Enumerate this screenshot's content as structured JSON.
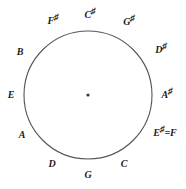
{
  "diagram": {
    "circle": {
      "center_x": 88,
      "center_y": 95,
      "radius": 64,
      "stroke_color": "#555555",
      "fill_color": "#ffffff"
    },
    "spokes": {
      "count": 12,
      "stroke_color": "#4a4a4a",
      "angle_step_degrees": 30
    },
    "notes": [
      {
        "id": "note-c-sharp",
        "label": "C♯",
        "base": "C",
        "accidental": "♯",
        "angle_degrees": 90,
        "label_x": 90,
        "label_y": 15
      },
      {
        "id": "note-g-sharp",
        "label": "G♯",
        "base": "G",
        "accidental": "♯",
        "angle_degrees": 60,
        "label_x": 129,
        "label_y": 22
      },
      {
        "id": "note-d-sharp",
        "label": "D♯",
        "base": "D",
        "accidental": "♯",
        "angle_degrees": 30,
        "label_x": 161,
        "label_y": 50
      },
      {
        "id": "note-a-sharp",
        "label": "A♯",
        "base": "A",
        "accidental": "♯",
        "angle_degrees": 0,
        "label_x": 167,
        "label_y": 95
      },
      {
        "id": "note-e-sharp-f",
        "label": "E♯=F",
        "base": "E",
        "accidental": "♯",
        "equals": "=F",
        "angle_degrees": -30,
        "label_x": 165,
        "label_y": 133
      },
      {
        "id": "note-c",
        "label": "C",
        "base": "C",
        "accidental": "",
        "angle_degrees": -60,
        "label_x": 124,
        "label_y": 164
      },
      {
        "id": "note-g",
        "label": "G",
        "base": "G",
        "accidental": "",
        "angle_degrees": -90,
        "label_x": 88,
        "label_y": 175
      },
      {
        "id": "note-d",
        "label": "D",
        "base": "D",
        "accidental": "",
        "angle_degrees": -120,
        "label_x": 52,
        "label_y": 164
      },
      {
        "id": "note-a",
        "label": "A",
        "base": "A",
        "accidental": "",
        "angle_degrees": -150,
        "label_x": 22,
        "label_y": 135
      },
      {
        "id": "note-e",
        "label": "E",
        "base": "E",
        "accidental": "",
        "angle_degrees": 180,
        "label_x": 11,
        "label_y": 95
      },
      {
        "id": "note-b",
        "label": "B",
        "base": "B",
        "accidental": "",
        "angle_degrees": 150,
        "label_x": 20,
        "label_y": 52
      },
      {
        "id": "note-f-sharp",
        "label": "F♯",
        "base": "F",
        "accidental": "♯",
        "angle_degrees": 120,
        "label_x": 53,
        "label_y": 21
      }
    ]
  }
}
